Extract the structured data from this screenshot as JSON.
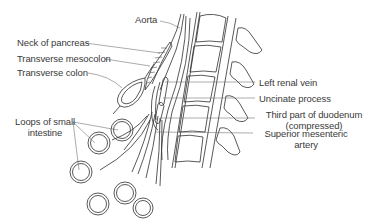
{
  "diagram": {
    "labels": {
      "aorta": "Aorta",
      "neck_of_pancreas": "Neck of pancreas",
      "transverse_mesocolon": "Transverse mesocolon",
      "transverse_colon": "Transverse  colon",
      "left_renal_vein": "Left renal vein",
      "uncinate_process": "Uncinate process",
      "third_part_duodenum_line1": "Third part of duodenum",
      "third_part_duodenum_line2": "(compressed)",
      "loops_small_intestine_line1": "Loops of small",
      "loops_small_intestine_line2": "intestine",
      "superior_mesenteric_line1": "Superior mesenteric",
      "superior_mesenteric_line2": "artery"
    },
    "colors": {
      "line": "#2e2e2e",
      "text": "#3a3a3a",
      "background": "#ffffff"
    }
  }
}
